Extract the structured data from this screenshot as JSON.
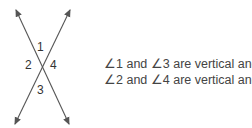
{
  "diagram": {
    "lines": [
      {
        "from": [
          16,
          10
        ],
        "to": [
          69,
          124
        ],
        "arrows": "both"
      },
      {
        "from": [
          70,
          10
        ],
        "to": [
          15,
          124
        ],
        "arrows": "both"
      }
    ],
    "angle_labels": [
      "1",
      "2",
      "3",
      "4"
    ],
    "stroke_color": "#555555"
  },
  "statements": [
    "∠1 and ∠3 are vertical angles.",
    "∠2 and ∠4 are vertical angles."
  ]
}
